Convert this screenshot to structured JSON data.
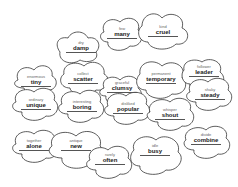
{
  "bubbles": [
    {
      "hint": "dry",
      "word": "damp"
    },
    {
      "hint": "few",
      "word": "many"
    },
    {
      "hint": "kind",
      "word": "cruel"
    },
    {
      "hint": "enormous",
      "word": "tiny"
    },
    {
      "hint": "collect",
      "word": "scatter"
    },
    {
      "hint": "graceful",
      "word": "clumsy"
    },
    {
      "hint": "permanent",
      "word": "temporary"
    },
    {
      "hint": "follower",
      "word": "leader"
    },
    {
      "hint": "ordinary",
      "word": "unique"
    },
    {
      "hint": "interesting",
      "word": "boring"
    },
    {
      "hint": "disliked",
      "word": "popular"
    },
    {
      "hint": "whisper",
      "word": "shout"
    },
    {
      "hint": "shaky",
      "word": "steady"
    },
    {
      "hint": "together",
      "word": "alone"
    },
    {
      "hint": "antique",
      "word": "new"
    },
    {
      "hint": "rarely",
      "word": "often"
    },
    {
      "hint": "idle",
      "word": "busy"
    },
    {
      "hint": "divide",
      "word": "combine"
    }
  ]
}
